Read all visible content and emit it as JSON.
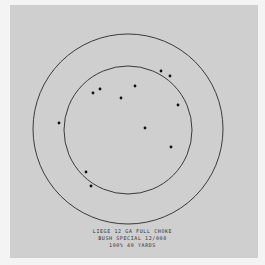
{
  "pattern_sheet": {
    "caption": {
      "line1": "LIEGE 12 GA FULL CHOKE",
      "line2": "BUSH SPECIAL 12/008",
      "line3": "100% 40 YARDS"
    },
    "rings": [
      {
        "name": "outer-ring",
        "cx": 128,
        "cy": 129,
        "r": 95
      },
      {
        "name": "inner-ring",
        "cx": 128,
        "cy": 130,
        "r": 64
      }
    ],
    "pellet_hits": [
      {
        "x": 161,
        "y": 71
      },
      {
        "x": 170,
        "y": 76
      },
      {
        "x": 100,
        "y": 89
      },
      {
        "x": 93,
        "y": 93
      },
      {
        "x": 135,
        "y": 86
      },
      {
        "x": 121,
        "y": 98
      },
      {
        "x": 178,
        "y": 105
      },
      {
        "x": 59,
        "y": 123
      },
      {
        "x": 145,
        "y": 128
      },
      {
        "x": 171,
        "y": 147
      },
      {
        "x": 86,
        "y": 172
      },
      {
        "x": 91,
        "y": 186
      }
    ],
    "colors": {
      "paper": "#cfcfcf",
      "ink": "#3a3a3a",
      "background": "#f4f4f4"
    }
  }
}
